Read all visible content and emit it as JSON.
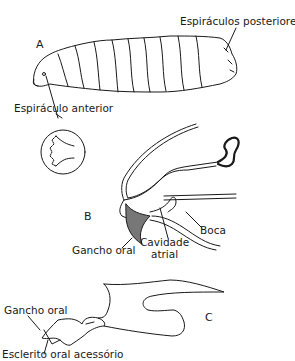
{
  "figure": {
    "panel_a": {
      "letter": "A",
      "labels": {
        "posterior_spiracles": "Espiráculos posteriores",
        "anterior_spiracle": "Espiráculo anterior"
      }
    },
    "panel_b": {
      "letter": "B",
      "labels": {
        "mouth": "Boca",
        "oral_hook": "Gancho oral",
        "atrial_cavity_line1": "Cavidade",
        "atrial_cavity_line2": "atrial"
      }
    },
    "panel_c": {
      "letter": "C",
      "labels": {
        "oral_hook": "Gancho oral",
        "accessory_oral_sclerite": "Esclerito oral acessório"
      }
    },
    "colors": {
      "ink": "#1a1a1a",
      "background": "#ffffff"
    }
  }
}
